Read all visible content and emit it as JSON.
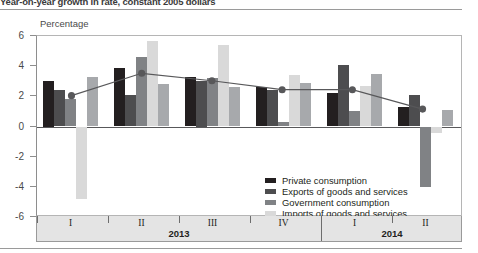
{
  "header": {
    "subtitle": "Year-on-year growth in rate, constant 2005 dollars"
  },
  "chart_data": {
    "type": "bar",
    "title": "",
    "ylabel": "Percentage",
    "xlabel": "",
    "ylim": [
      -6,
      6
    ],
    "yticks": [
      6,
      4,
      2,
      0,
      -2,
      -4,
      -6
    ],
    "grid": false,
    "legend_position": "inside-center",
    "categories": [
      "I",
      "II",
      "III",
      "IV",
      "I",
      "II"
    ],
    "period_groups": [
      {
        "year": "2013",
        "quarters": [
          "I",
          "II",
          "III",
          "IV"
        ]
      },
      {
        "year": "2014",
        "quarters": [
          "I",
          "II"
        ]
      }
    ],
    "series": [
      {
        "name": "Private consumption",
        "color": "#231f20",
        "values": [
          3.0,
          3.9,
          3.3,
          2.6,
          2.2,
          1.3
        ]
      },
      {
        "name": "Exports of goods and services",
        "color": "#4d4d4f",
        "values": [
          2.4,
          2.1,
          3.0,
          2.4,
          4.1,
          2.1
        ]
      },
      {
        "name": "Government consumption",
        "color": "#808285",
        "values": [
          1.8,
          4.6,
          3.2,
          0.3,
          1.0,
          -4.0
        ]
      },
      {
        "name": "Imports of goods and services",
        "color": "#d9d9d9",
        "values": [
          -4.8,
          5.7,
          5.4,
          3.4,
          2.7,
          -0.4
        ]
      },
      {
        "name": "Gross fixed-capital formation",
        "color": "#a7a9ac",
        "values": [
          3.3,
          2.8,
          2.6,
          2.9,
          3.5,
          1.1
        ]
      }
    ],
    "line_series": {
      "name": "GDP",
      "color": "#58585a",
      "marker": "circle",
      "values": [
        2.0,
        3.5,
        3.0,
        2.4,
        2.4,
        1.1
      ]
    }
  },
  "legend": {
    "items": [
      {
        "label": "Private consumption",
        "color": "#231f20",
        "type": "bar"
      },
      {
        "label": "Exports of goods and services",
        "color": "#4d4d4f",
        "type": "bar"
      },
      {
        "label": "Government consumption",
        "color": "#808285",
        "type": "bar"
      },
      {
        "label": "Imports of goods and services",
        "color": "#d9d9d9",
        "type": "bar"
      },
      {
        "label": "Gross fixed-capital formation",
        "color": "#a7a9ac",
        "type": "bar"
      },
      {
        "label": "GDP",
        "color": "#58585a",
        "type": "line-marker"
      }
    ]
  }
}
